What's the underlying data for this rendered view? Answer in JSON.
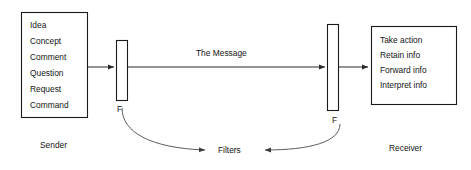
{
  "diagram": {
    "background_color": "#ffffff",
    "line_color": "#2b2b2b",
    "text_color": "#141414"
  },
  "sender": {
    "role_label": "Sender",
    "items": [
      "Idea",
      "Concept",
      "Comment",
      "Question",
      "Request",
      "Command"
    ]
  },
  "receiver": {
    "role_label": "Receiver",
    "items": [
      "Take action",
      "Retain info",
      "Forward info",
      "Interpret info"
    ]
  },
  "filters": {
    "sender_filter_label": "F",
    "receiver_filter_label": "F",
    "caption": "Filters"
  },
  "message": {
    "label": "The Message"
  }
}
